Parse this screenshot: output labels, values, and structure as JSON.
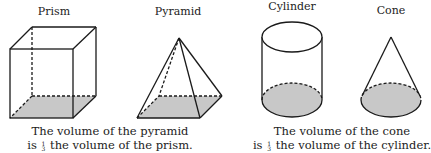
{
  "figures": {
    "prism": {
      "label": "Prism"
    },
    "pyramid": {
      "label": "Pyramid"
    },
    "cylinder": {
      "label": "Cylinder"
    },
    "cone": {
      "label": "Cone"
    }
  },
  "captions": {
    "left": {
      "line1": "The volume of the pyramid",
      "line2_prefix": "is",
      "fraction_num": "1",
      "fraction_den": "3",
      "line2_suffix": "the volume of the prism."
    },
    "right": {
      "line1": "The volume of the cone",
      "line2_prefix": "is",
      "fraction_num": "1",
      "fraction_den": "3",
      "line2_suffix": "the volume of the cylinder."
    }
  },
  "colors": {
    "stroke": "#1a1a1a",
    "base_fill": "#c8c8c8",
    "background": "#ffffff"
  }
}
